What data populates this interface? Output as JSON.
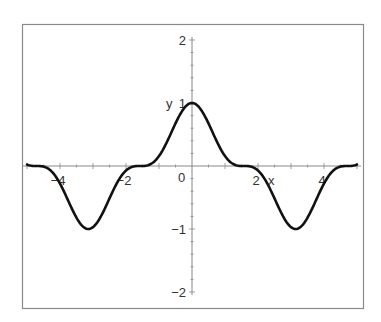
{
  "chart_data": {
    "type": "line",
    "title": "",
    "xlabel": "x",
    "ylabel": "y",
    "xlim": [
      -5,
      5
    ],
    "ylim": [
      -2,
      2
    ],
    "grid": false,
    "legend": null,
    "x_ticks": [
      -4,
      -2,
      2,
      4
    ],
    "x_tick_labels": [
      "−4",
      "−2",
      "2",
      "4"
    ],
    "y_ticks": [
      2,
      1,
      -1,
      -2
    ],
    "y_tick_labels": [
      "2",
      "1",
      "−1",
      "−2"
    ],
    "origin_label": "0",
    "series": [
      {
        "name": "y = cos³(x)",
        "color": "#111111",
        "x": [
          -5,
          -4.5,
          -4,
          -3.5,
          -3.14,
          -3,
          -2.5,
          -2,
          -1.57,
          -1.5,
          -1,
          -0.5,
          0,
          0.5,
          1,
          1.5,
          1.57,
          2,
          2.5,
          3,
          3.14,
          3.5,
          4,
          4.5,
          5
        ],
        "values": [
          0.023,
          -0.007,
          -0.281,
          -0.829,
          -1.0,
          -0.97,
          -0.513,
          -0.072,
          0.0,
          0.0003,
          0.158,
          0.675,
          1.0,
          0.675,
          0.158,
          0.0003,
          0.0,
          -0.072,
          -0.513,
          -0.97,
          -1.0,
          -0.829,
          -0.281,
          -0.007,
          0.023
        ]
      }
    ]
  },
  "frame_color": "#8a8a8a",
  "axis_color": "#888888"
}
